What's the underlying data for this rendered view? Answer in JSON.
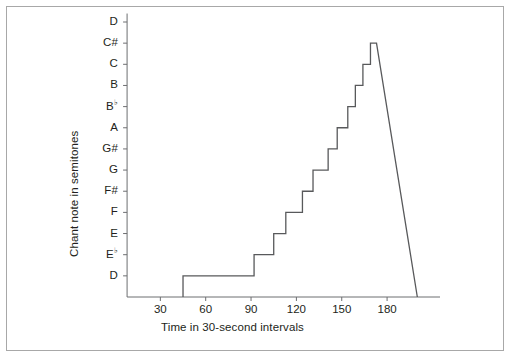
{
  "chart_data": {
    "type": "line",
    "title": "",
    "xlabel": "Time in 30-second intervals",
    "ylabel": "Chant note in semitones",
    "grid": false,
    "legend": "none",
    "xlim": [
      0,
      215
    ],
    "xticks": [
      30,
      60,
      90,
      120,
      150,
      180
    ],
    "xtick_labels": [
      "30",
      "60",
      "90",
      "120",
      "150",
      "180"
    ],
    "ylim": [
      -1,
      12
    ],
    "yticks": [
      0,
      1,
      2,
      3,
      4,
      5,
      6,
      7,
      8,
      9,
      10,
      11,
      12
    ],
    "ytick_labels": [
      "D",
      "E♭",
      "E",
      "F",
      "F#",
      "G",
      "G#",
      "A",
      "B♭",
      "B",
      "C",
      "C#",
      "D"
    ],
    "ytick_labels_plain": [
      "D",
      "Eb",
      "E",
      "F",
      "F#",
      "G",
      "G#",
      "A",
      "Bb",
      "B",
      "C",
      "C#",
      "D"
    ],
    "note_semitone_values": [
      0,
      1,
      2,
      3,
      4,
      5,
      6,
      7,
      8,
      9,
      10,
      11,
      12
    ],
    "series": [
      {
        "name": "Chant pitch",
        "style": "step-post",
        "color": "#58595b",
        "steps": [
          {
            "x_start": 45,
            "x_end": 92,
            "note": "D",
            "level": 0
          },
          {
            "x_start": 92,
            "x_end": 105,
            "note": "E♭",
            "level": 1
          },
          {
            "x_start": 105,
            "x_end": 113,
            "note": "E",
            "level": 2
          },
          {
            "x_start": 113,
            "x_end": 124,
            "note": "F",
            "level": 3
          },
          {
            "x_start": 124,
            "x_end": 131,
            "note": "F#",
            "level": 4
          },
          {
            "x_start": 131,
            "x_end": 141,
            "note": "G",
            "level": 5
          },
          {
            "x_start": 141,
            "x_end": 147,
            "note": "G#",
            "level": 6
          },
          {
            "x_start": 147,
            "x_end": 154,
            "note": "A",
            "level": 7
          },
          {
            "x_start": 154,
            "x_end": 159,
            "note": "B♭",
            "level": 8
          },
          {
            "x_start": 159,
            "x_end": 164,
            "note": "B",
            "level": 9
          },
          {
            "x_start": 164,
            "x_end": 169,
            "note": "C",
            "level": 10
          },
          {
            "x_start": 169,
            "x_end": 173,
            "note": "C#",
            "level": 11
          }
        ],
        "descent": {
          "from_x": 173,
          "from_level": 11,
          "to_x": 200,
          "to_level": -1,
          "description": "straight diagonal fall from peak to baseline"
        },
        "baseline_start": {
          "x": 45,
          "level": -1
        }
      }
    ],
    "peak": {
      "x": 173,
      "note": "C#",
      "level": 11
    },
    "start": {
      "x": 45,
      "note": "D",
      "level": 0
    },
    "end": {
      "x": 200,
      "note": "below D",
      "level": -1
    }
  },
  "axis": {
    "y_title": "Chant note in semitones",
    "x_title": "Time in 30-second intervals"
  },
  "colors": {
    "line": "#58595b",
    "axis": "#6d6e71",
    "frame": "#a8a8a8",
    "text": "#231f20",
    "background": "#ffffff"
  }
}
